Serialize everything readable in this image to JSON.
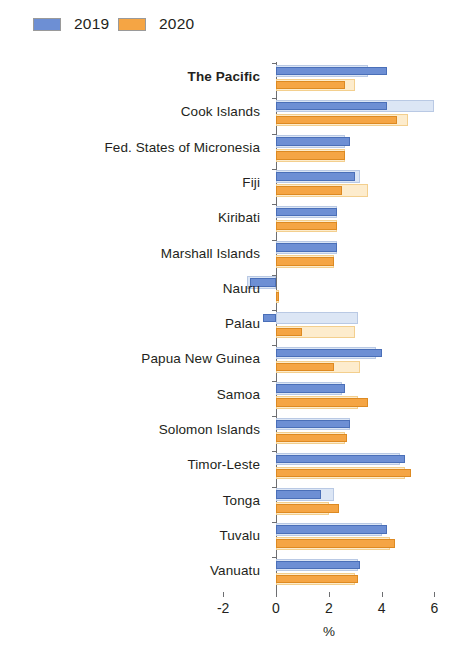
{
  "legend": {
    "items": [
      {
        "label": "2019",
        "color": "#6d8fd4",
        "name": "legend-2019"
      },
      {
        "label": "2020",
        "color": "#f5a544",
        "name": "legend-2020"
      }
    ]
  },
  "axis": {
    "ticks": [
      "-2",
      "0",
      "2",
      "4",
      "6"
    ],
    "tick_values": [
      -2,
      0,
      2,
      4,
      6
    ],
    "title": "%"
  },
  "chart_data": {
    "type": "bar",
    "orientation": "horizontal",
    "title": "",
    "subtitle": "",
    "xlabel": "%",
    "ylabel": "",
    "xlim": [
      -2,
      6
    ],
    "grid": false,
    "legend_position": "top-left",
    "categories": [
      "The Pacific",
      "Cook Islands",
      "Fed. States of Micronesia",
      "Fiji",
      "Kiribati",
      "Marshall Islands",
      "Nauru",
      "Palau",
      "Papua New Guinea",
      "Samoa",
      "Solomon Islands",
      "Timor-Leste",
      "Tonga",
      "Tuvalu",
      "Vanuatu"
    ],
    "highlight_category": "The Pacific",
    "series": [
      {
        "name": "2019",
        "style": "dark-blue",
        "values": [
          4.2,
          4.2,
          2.8,
          3.0,
          2.3,
          2.3,
          -1.0,
          -0.5,
          4.0,
          2.6,
          2.8,
          4.9,
          1.7,
          4.2,
          3.2
        ]
      },
      {
        "name": "2019 reference",
        "style": "light-blue",
        "values": [
          3.5,
          6.0,
          2.6,
          3.2,
          2.3,
          2.3,
          -1.1,
          3.1,
          3.8,
          2.5,
          2.8,
          4.7,
          2.2,
          4.0,
          3.1
        ]
      },
      {
        "name": "2020",
        "style": "dark-orange",
        "values": [
          2.6,
          4.6,
          2.6,
          2.5,
          2.3,
          2.2,
          0.1,
          1.0,
          2.2,
          3.5,
          2.7,
          5.1,
          2.4,
          4.5,
          3.1
        ]
      },
      {
        "name": "2020 reference",
        "style": "light-orange",
        "values": [
          3.0,
          5.0,
          2.6,
          3.5,
          2.3,
          2.2,
          0.1,
          3.0,
          3.2,
          3.1,
          2.6,
          4.9,
          2.0,
          4.3,
          3.0
        ]
      }
    ]
  }
}
